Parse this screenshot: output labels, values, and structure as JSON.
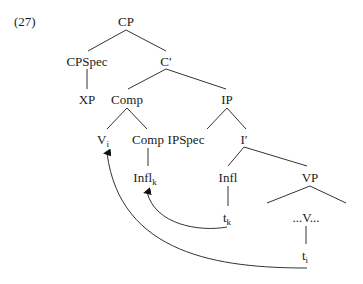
{
  "example_number": "(27)",
  "nodes": {
    "cp": {
      "label": "CP",
      "x": 126,
      "y": 26
    },
    "cpspec": {
      "label": "CPSpec",
      "x": 87,
      "y": 66
    },
    "cbar": {
      "label": "C′",
      "x": 166,
      "y": 66
    },
    "xp": {
      "label": "XP",
      "x": 87,
      "y": 104
    },
    "comp_top": {
      "label": "Comp",
      "x": 127,
      "y": 104
    },
    "ip": {
      "label": "IP",
      "x": 227,
      "y": 104
    },
    "v": {
      "label": "V",
      "sub": "i",
      "x": 105,
      "y": 144
    },
    "comp_low": {
      "label": "Comp",
      "x": 148,
      "y": 144
    },
    "ipspec": {
      "label": "IPSpec",
      "x": 186,
      "y": 144
    },
    "ibar": {
      "label": "I′",
      "x": 244,
      "y": 144
    },
    "infl_k": {
      "label": "Infl",
      "sub": "k",
      "x": 144,
      "y": 182
    },
    "infl": {
      "label": "Infl",
      "x": 228,
      "y": 182
    },
    "vp": {
      "label": "VP",
      "x": 310,
      "y": 182
    },
    "t_k": {
      "label": "t",
      "sub": "k",
      "x": 226,
      "y": 222
    },
    "v_dots": {
      "label": "...V...",
      "x": 306,
      "y": 222
    },
    "t_i": {
      "label": "t",
      "sub": "i",
      "x": 304,
      "y": 260
    }
  },
  "edges": [
    [
      "cp",
      "cpspec"
    ],
    [
      "cp",
      "cbar"
    ],
    [
      "cpspec",
      "xp"
    ],
    [
      "cbar",
      "comp_top"
    ],
    [
      "cbar",
      "ip"
    ],
    [
      "comp_top",
      "v"
    ],
    [
      "comp_top",
      "comp_low"
    ],
    [
      "comp_low",
      "infl_k"
    ],
    [
      "ip",
      "ipspec"
    ],
    [
      "ip",
      "ibar"
    ],
    [
      "ibar",
      "infl"
    ],
    [
      "ibar",
      "vp"
    ],
    [
      "infl",
      "t_k"
    ],
    [
      "vp",
      "v_dots_left"
    ],
    [
      "vp",
      "v_dots_right"
    ],
    [
      "v_dots",
      "t_i"
    ]
  ],
  "movements": [
    {
      "from": "t_k",
      "to": "infl_k",
      "description": "Infl moves to Comp"
    },
    {
      "from": "t_i",
      "to": "v",
      "description": "V moves to Comp"
    }
  ],
  "colors": {
    "ink": "#333333",
    "text": "#1a1a1a",
    "background": "#ffffff"
  }
}
